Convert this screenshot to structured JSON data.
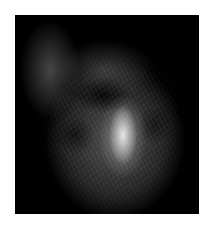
{
  "image": {
    "subject": "fluorescence-microscopy-cell",
    "description": "Grayscale fluorescence micrograph of a single cell with filamentous cytoskeleton and bright central spindle-shaped region on black background",
    "background_color": "#ffffff",
    "frame_color": "#000000",
    "bright_region_color": "#ebebeb"
  }
}
